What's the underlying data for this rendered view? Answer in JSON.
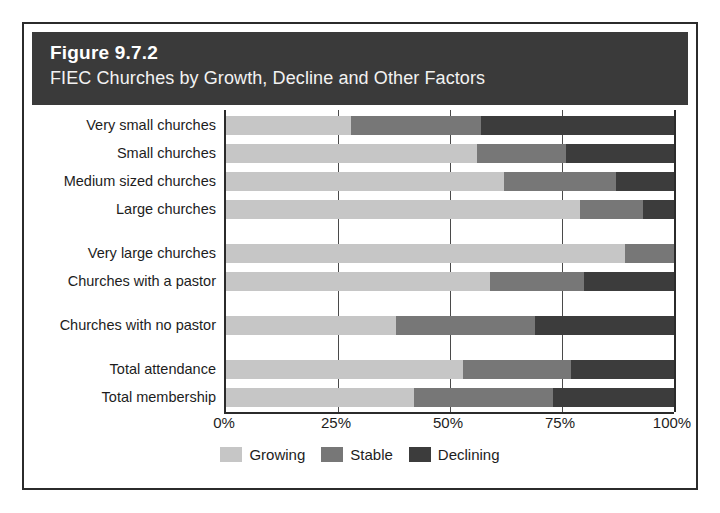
{
  "figure": {
    "number": "Figure 9.7.2",
    "title": "FIEC Churches by Growth, Decline and Other Factors"
  },
  "chart_data": {
    "type": "bar",
    "orientation": "horizontal",
    "stacked": true,
    "normalized": true,
    "title": "FIEC Churches by Growth, Decline and Other Factors",
    "xlabel": "",
    "ylabel": "",
    "xlim": [
      0,
      100
    ],
    "xticks": [
      0,
      25,
      50,
      75,
      100
    ],
    "xtick_labels": [
      "0%",
      "25%",
      "50%",
      "75%",
      "100%"
    ],
    "grid": true,
    "legend_position": "bottom-center",
    "categories": [
      "Very small churches",
      "Small churches",
      "Medium sized churches",
      "Large churches",
      "Very large churches",
      "Churches with a pastor",
      "Churches with no pastor",
      "Total attendance",
      "Total membership"
    ],
    "group_breaks_after": [
      4,
      6,
      7
    ],
    "series": [
      {
        "name": "Growing",
        "color": "#c6c6c6",
        "values": [
          28,
          56,
          62,
          79,
          89,
          59,
          38,
          53,
          42
        ]
      },
      {
        "name": "Stable",
        "color": "#777777",
        "values": [
          29,
          20,
          25,
          14,
          11,
          21,
          31,
          24,
          31
        ]
      },
      {
        "name": "Declining",
        "color": "#3c3c3c",
        "values": [
          43,
          24,
          13,
          7,
          0,
          20,
          31,
          23,
          27
        ]
      }
    ]
  }
}
